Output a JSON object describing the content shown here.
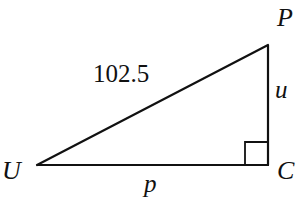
{
  "diagram": {
    "type": "right-triangle",
    "vertices": {
      "U": {
        "label": "U",
        "x": 37,
        "y": 165
      },
      "C": {
        "label": "C",
        "x": 268,
        "y": 165
      },
      "P": {
        "label": "P",
        "x": 268,
        "y": 45
      }
    },
    "sides": {
      "hypotenuse": {
        "from": "U",
        "to": "P",
        "label": "102.5"
      },
      "vertical": {
        "from": "P",
        "to": "C",
        "label": "u"
      },
      "base": {
        "from": "U",
        "to": "C",
        "label": "p"
      }
    },
    "right_angle_at": "C",
    "colors": {
      "stroke": "#111111",
      "background": "#ffffff"
    }
  }
}
